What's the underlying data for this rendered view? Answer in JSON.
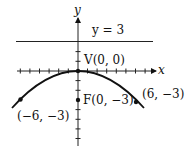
{
  "figure": {
    "axis_x_label": "x",
    "axis_y_label": "y",
    "directrix_label": "y = 3",
    "vertex_label": "V(0, 0)",
    "focus_label": "F(0, −3)",
    "point_left_label": "(−6, −3)",
    "point_right_label": "(6, −3)"
  },
  "colors": {
    "ink": "#111111",
    "background": "#ffffff"
  }
}
